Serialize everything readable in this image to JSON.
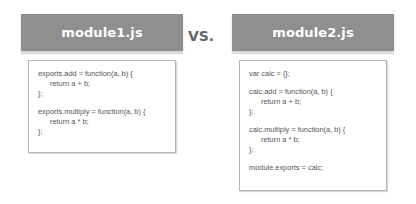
{
  "left": {
    "title": "module1.js",
    "code_lines": [
      {
        "text": "exports.add = function(a, b) {",
        "indent": false
      },
      {
        "text": "return a + b;",
        "indent": true
      },
      {
        "text": "};",
        "indent": false
      },
      {
        "text": "",
        "indent": false
      },
      {
        "text": "exports.multiply = function(a, b) {",
        "indent": false
      },
      {
        "text": "return a * b;",
        "indent": true
      },
      {
        "text": "};",
        "indent": false
      }
    ]
  },
  "separator": {
    "label": "VS."
  },
  "right": {
    "title": "module2.js",
    "code_lines": [
      {
        "text": "var calc = {};",
        "indent": false
      },
      {
        "text": "",
        "indent": false
      },
      {
        "text": "calc.add = function(a, b) {",
        "indent": false
      },
      {
        "text": "return a + b;",
        "indent": true
      },
      {
        "text": "};",
        "indent": false
      },
      {
        "text": "",
        "indent": false
      },
      {
        "text": "calc.multiply = function(a, b) {",
        "indent": false
      },
      {
        "text": "return a * b;",
        "indent": true
      },
      {
        "text": "};",
        "indent": false
      },
      {
        "text": "",
        "indent": false
      },
      {
        "text": "module.exports = calc;",
        "indent": false
      }
    ]
  },
  "colors": {
    "header_bg": "#8f8f8f",
    "header_text": "#ffffff",
    "code_text": "#555555",
    "box_border": "#b5b5b5",
    "vs_text": "#666666"
  }
}
